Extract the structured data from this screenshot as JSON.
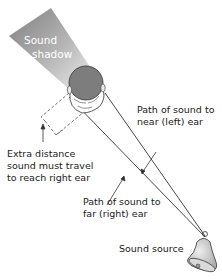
{
  "diagram": {
    "labels": {
      "sound_shadow_line1": "Sound",
      "sound_shadow_line2": "shadow",
      "near_path_line1": "Path of sound to",
      "near_path_line2": "near (left) ear",
      "far_path_line1": "Path of sound to",
      "far_path_line2": "far (right) ear",
      "extra_distance_line1": "Extra distance",
      "extra_distance_line2": "sound must travel",
      "extra_distance_line3": "to reach right ear",
      "sound_source": "Sound source"
    },
    "elements": {
      "head": "top-down head",
      "bell": "bell-icon",
      "shadow": "sound-shadow-wedge",
      "bracket": "dashed-extra-distance-bracket"
    },
    "colors": {
      "shadow_dark": "#8a8a8a",
      "shadow_light": "#e6e6e6",
      "head": "#7d7d7d",
      "bell": "#c8c8c8",
      "line": "#333333"
    }
  }
}
